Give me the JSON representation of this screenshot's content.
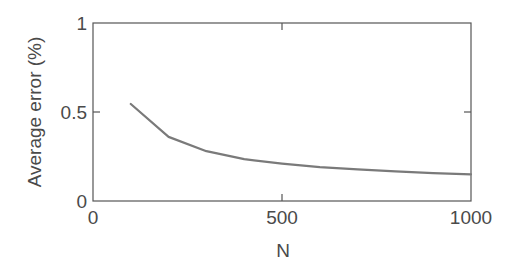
{
  "chart_data": {
    "type": "line",
    "title": "",
    "xlabel": "N",
    "ylabel": "Average error (%)",
    "xlim": [
      0,
      1000
    ],
    "ylim": [
      0,
      1
    ],
    "xticks": [
      0,
      500,
      1000
    ],
    "xtick_labels": [
      "0",
      "500",
      "1000"
    ],
    "yticks": [
      0,
      0.5,
      1
    ],
    "ytick_labels": [
      "0",
      "0.5",
      "1"
    ],
    "grid": false,
    "legend": null,
    "series": [
      {
        "name": "Average error",
        "color": "#7a7a7a",
        "x": [
          100,
          200,
          300,
          400,
          500,
          600,
          700,
          800,
          900,
          1000
        ],
        "y": [
          0.545,
          0.36,
          0.28,
          0.235,
          0.21,
          0.19,
          0.178,
          0.167,
          0.157,
          0.15
        ]
      }
    ]
  },
  "style": {
    "axis_color": "#555555",
    "text_color": "#4a4a4a"
  }
}
